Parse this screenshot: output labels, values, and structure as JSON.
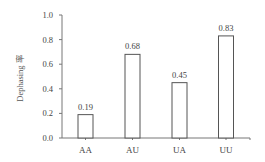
{
  "chart_data": {
    "type": "bar",
    "title": "",
    "xlabel": "",
    "ylabel": "Dephasing 率",
    "categories": [
      "AA",
      "AU",
      "UA",
      "UU"
    ],
    "values": [
      0.19,
      0.68,
      0.45,
      0.83
    ],
    "value_labels": [
      "0.19",
      "0.68",
      "0.45",
      "0.83"
    ],
    "ylim": [
      0.0,
      1.0
    ],
    "yticks": [
      "0.0",
      "0.2",
      "0.4",
      "0.6",
      "0.8",
      "1.0"
    ],
    "grid": false,
    "legend": null,
    "bar_style": {
      "fill": "#ffffff",
      "stroke": "#555555"
    }
  }
}
